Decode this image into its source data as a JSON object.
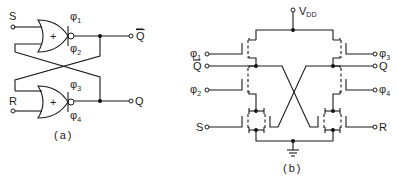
{
  "figure": {
    "panel_a": {
      "caption": "(a)",
      "gates": [
        {
          "name": "upper NOR gate",
          "symbol": "+",
          "clock_top": "φ",
          "clock_top_sub": "1",
          "clock_bottom": "φ",
          "clock_bottom_sub": "2"
        },
        {
          "name": "lower NOR gate",
          "symbol": "+",
          "clock_top": "φ",
          "clock_top_sub": "3",
          "clock_bottom": "φ",
          "clock_bottom_sub": "4"
        }
      ],
      "inputs": {
        "set": "S",
        "reset": "R"
      },
      "outputs": {
        "q_bar": "Q",
        "q": "Q"
      }
    },
    "panel_b": {
      "caption": "(b)",
      "supply": {
        "label": "V",
        "sub": "DD"
      },
      "left_terminals": [
        {
          "label": "φ",
          "sub": "1"
        },
        {
          "label": "Q",
          "overbar": true
        },
        {
          "label": "φ",
          "sub": "2"
        },
        {
          "label": "S"
        }
      ],
      "right_terminals": [
        {
          "label": "φ",
          "sub": "3"
        },
        {
          "label": "Q"
        },
        {
          "label": "φ",
          "sub": "4"
        },
        {
          "label": "R"
        }
      ],
      "ground": "ground"
    }
  }
}
